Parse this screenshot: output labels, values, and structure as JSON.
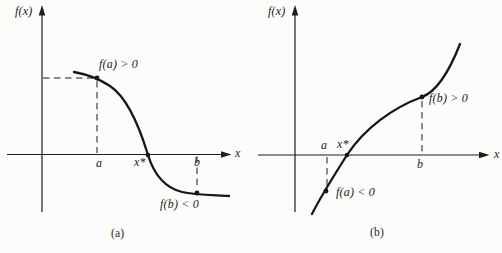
{
  "figure": {
    "colors": {
      "background": "#fcfcfa",
      "line": "#1d1d1b",
      "curve": "#161614"
    },
    "panels": {
      "a": {
        "caption": "(a)",
        "y_axis_label": "f(x)",
        "x_axis_label": "x",
        "point_labels": {
          "a": "a",
          "x_star": "x*",
          "b": "b"
        },
        "annotations": {
          "f_at_a": "f(a) > 0",
          "f_at_b": "f(b) < 0"
        }
      },
      "b": {
        "caption": "(b)",
        "y_axis_label": "f(x)",
        "x_axis_label": "x",
        "point_labels": {
          "a": "a",
          "x_star": "x*",
          "b": "b"
        },
        "annotations": {
          "f_at_a": "f(a) < 0",
          "f_at_b": "f(b) > 0"
        }
      }
    }
  }
}
